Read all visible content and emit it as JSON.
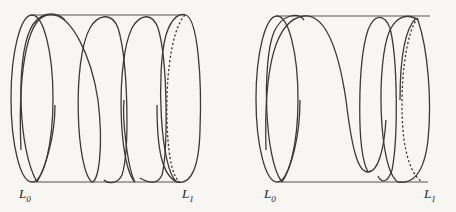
{
  "figures": [
    {
      "id": "left",
      "description": "helix coil wound around a cylinder with evenly spaced turns",
      "labels": {
        "start": "L",
        "start_sub": "0",
        "end": "L",
        "end_sub": "1"
      }
    },
    {
      "id": "right",
      "description": "helix coil wound around a cylinder with a stretched middle turn",
      "labels": {
        "start": "L",
        "start_sub": "0",
        "end": "L",
        "end_sub": "1"
      }
    }
  ],
  "colors": {
    "line": "#3a3a3a",
    "background": "#f7f6f3"
  }
}
